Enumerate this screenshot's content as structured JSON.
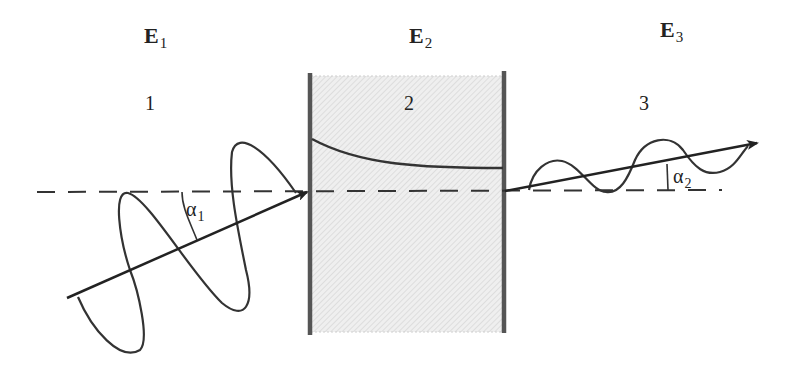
{
  "labels": {
    "e1": {
      "main": "E",
      "sub": "1"
    },
    "e2": {
      "main": "E",
      "sub": "2"
    },
    "e3": {
      "main": "E",
      "sub": "3"
    },
    "region1": "1",
    "region2": "2",
    "region3": "3",
    "alpha1": {
      "main": "α",
      "sub": "1"
    },
    "alpha2": {
      "main": "α",
      "sub": "2"
    }
  },
  "colors": {
    "stroke": "#333333",
    "wall": "#555555",
    "medium_fill": "#e6e6e6"
  }
}
